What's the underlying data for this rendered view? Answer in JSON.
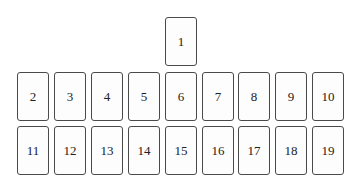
{
  "diagram": {
    "top_card": {
      "label": "1"
    },
    "row1": [
      {
        "label": "2"
      },
      {
        "label": "3"
      },
      {
        "label": "4"
      },
      {
        "label": "5"
      },
      {
        "label": "6"
      },
      {
        "label": "7"
      },
      {
        "label": "8"
      },
      {
        "label": "9"
      },
      {
        "label": "10"
      }
    ],
    "row2": [
      {
        "label": "11"
      },
      {
        "label": "12"
      },
      {
        "label": "13"
      },
      {
        "label": "14"
      },
      {
        "label": "15"
      },
      {
        "label": "16"
      },
      {
        "label": "17"
      },
      {
        "label": "18"
      },
      {
        "label": "19"
      }
    ]
  }
}
